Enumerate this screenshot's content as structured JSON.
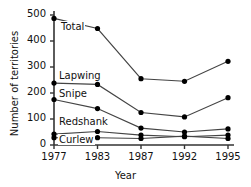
{
  "chart_data": {
    "type": "line",
    "title": "",
    "xlabel": "Year",
    "ylabel": "Number of territories",
    "x": [
      1977,
      1983,
      1987,
      1992,
      1995
    ],
    "xtick_labels": [
      "1977",
      "1983",
      "1987",
      "1992",
      "1995"
    ],
    "ytick_labels": [
      "0",
      "100",
      "200",
      "300",
      "400",
      "500"
    ],
    "yticks": [
      0,
      100,
      200,
      300,
      400,
      500
    ],
    "ylim": [
      0,
      500
    ],
    "grid": false,
    "legend_position": "inline-labels",
    "series": [
      {
        "name": "Total",
        "values": [
          487,
          448,
          255,
          245,
          322
        ]
      },
      {
        "name": "Lapwing",
        "values": [
          238,
          233,
          125,
          108,
          182
        ]
      },
      {
        "name": "Snipe",
        "values": [
          175,
          140,
          65,
          50,
          62
        ]
      },
      {
        "name": "Redshank",
        "values": [
          42,
          52,
          38,
          32,
          38
        ]
      },
      {
        "name": "Curlew",
        "values": [
          28,
          28,
          25,
          34,
          25
        ]
      }
    ],
    "marker": "filled-circle",
    "line_color": "#444444",
    "marker_color": "#000000",
    "axis_color": "#333333",
    "background": "#ffffff"
  },
  "annotations": {
    "series_labels": [
      {
        "name": "Total",
        "text": "Total"
      },
      {
        "name": "Lapwing",
        "text": "Lapwing"
      },
      {
        "name": "Snipe",
        "text": "Snipe"
      },
      {
        "name": "Redshank",
        "text": "Redshank"
      },
      {
        "name": "Curlew",
        "text": "Curlew"
      }
    ]
  }
}
